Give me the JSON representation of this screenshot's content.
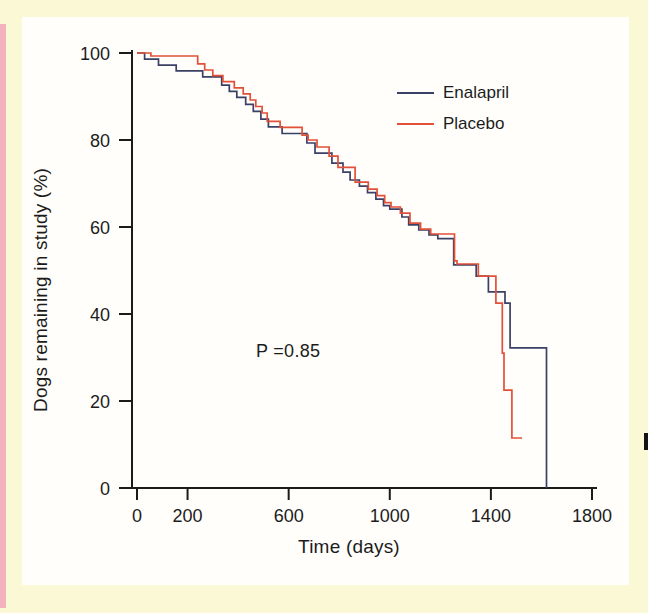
{
  "figure": {
    "p_value_label": "P =0.85"
  },
  "legend": {
    "items": [
      {
        "label": "Enalapril",
        "color": "#3b4166"
      },
      {
        "label": "Placebo",
        "color": "#e2503a"
      }
    ]
  },
  "chart_data": {
    "type": "line",
    "subtype": "step (Kaplan-Meier survival curve)",
    "title": "",
    "xlabel": "Time (days)",
    "ylabel": "Dogs remaining in study (%)",
    "xlim": [
      0,
      1800
    ],
    "ylim": [
      0,
      100
    ],
    "x_ticks": [
      0,
      200,
      600,
      1000,
      1400,
      1800
    ],
    "y_ticks": [
      0,
      20,
      40,
      60,
      80,
      100
    ],
    "grid": false,
    "legend_position": "upper right inside plot",
    "annotations": [
      {
        "text": "P =0.85",
        "x_days": 600,
        "y_pct": 31.5
      }
    ],
    "series": [
      {
        "name": "Enalapril",
        "color": "#3b4166",
        "step_points_day_pct": [
          [
            0,
            100
          ],
          [
            30,
            98.6
          ],
          [
            85,
            97.2
          ],
          [
            155,
            95.9
          ],
          [
            260,
            94.5
          ],
          [
            335,
            92.6
          ],
          [
            365,
            91.2
          ],
          [
            395,
            89.8
          ],
          [
            430,
            88.2
          ],
          [
            460,
            86.6
          ],
          [
            490,
            84.8
          ],
          [
            520,
            83.0
          ],
          [
            574,
            81.5
          ],
          [
            672,
            79.3
          ],
          [
            704,
            77.0
          ],
          [
            771,
            74.7
          ],
          [
            815,
            72.6
          ],
          [
            843,
            70.8
          ],
          [
            880,
            69.4
          ],
          [
            912,
            67.9
          ],
          [
            945,
            66.4
          ],
          [
            975,
            64.9
          ],
          [
            1000,
            64.1
          ],
          [
            1048,
            62.3
          ],
          [
            1075,
            60.5
          ],
          [
            1115,
            59.3
          ],
          [
            1155,
            58.2
          ],
          [
            1190,
            57.3
          ],
          [
            1253,
            51.3
          ],
          [
            1342,
            48.7
          ],
          [
            1390,
            45.1
          ],
          [
            1456,
            42.5
          ],
          [
            1476,
            32.2
          ],
          [
            1620,
            0
          ]
        ]
      },
      {
        "name": "Placebo",
        "color": "#e2503a",
        "step_points_day_pct": [
          [
            0,
            100
          ],
          [
            55,
            99.3
          ],
          [
            240,
            97.5
          ],
          [
            268,
            96.1
          ],
          [
            300,
            94.8
          ],
          [
            340,
            93.4
          ],
          [
            385,
            92.0
          ],
          [
            420,
            90.6
          ],
          [
            448,
            89.2
          ],
          [
            470,
            87.7
          ],
          [
            495,
            86.2
          ],
          [
            515,
            84.3
          ],
          [
            566,
            82.9
          ],
          [
            653,
            81.1
          ],
          [
            677,
            80.0
          ],
          [
            712,
            78.4
          ],
          [
            760,
            76.3
          ],
          [
            795,
            73.7
          ],
          [
            863,
            70.3
          ],
          [
            915,
            68.7
          ],
          [
            950,
            67.2
          ],
          [
            980,
            65.6
          ],
          [
            1005,
            64.6
          ],
          [
            1042,
            63.2
          ],
          [
            1080,
            60.9
          ],
          [
            1122,
            59.5
          ],
          [
            1162,
            58.4
          ],
          [
            1256,
            52.2
          ],
          [
            1266,
            51.5
          ],
          [
            1350,
            48.7
          ],
          [
            1420,
            42.5
          ],
          [
            1445,
            31.0
          ],
          [
            1452,
            22.5
          ],
          [
            1483,
            11.5
          ],
          [
            1523,
            11.5
          ]
        ]
      }
    ]
  },
  "colors": {
    "page_background": "#fbf8d6",
    "panel_background": "#fffefb",
    "left_edge_pink": "#f2b3be",
    "axis": "#1b1b1b",
    "text": "#1c1c1c"
  }
}
